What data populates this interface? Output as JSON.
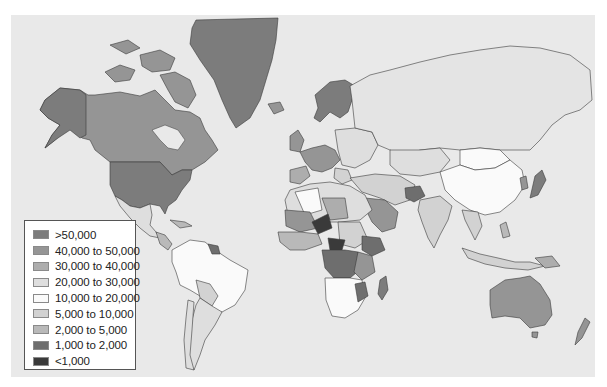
{
  "map": {
    "type": "choropleth",
    "region": "world",
    "projection": "mercator",
    "background_color": "#e9e9e9"
  },
  "legend": {
    "items": [
      {
        "label": ">50,000",
        "color": "#7c7c7c"
      },
      {
        "label": "40,000 to 50,000",
        "color": "#959595"
      },
      {
        "label": "30,000 to 40,000",
        "color": "#adadad"
      },
      {
        "label": "20,000 to 30,000",
        "color": "#dedede"
      },
      {
        "label": "10,000 to 20,000",
        "color": "#fafafa"
      },
      {
        "label": "5,000 to 10,000",
        "color": "#d2d2d2"
      },
      {
        "label": "2,000 to 5,000",
        "color": "#b9b9b9"
      },
      {
        "label": "1,000 to 2,000",
        "color": "#6e6e6e"
      },
      {
        "label": "<1,000",
        "color": "#3a3a3a"
      }
    ]
  }
}
